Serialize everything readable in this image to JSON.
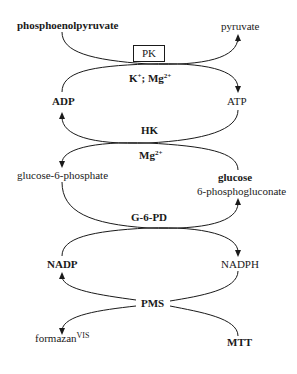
{
  "diagram": {
    "type": "coupled enzymatic reaction cascade",
    "nodes": {
      "phosphoenolpyruvate": "phosphoenolpyruvate",
      "pyruvate": "pyruvate",
      "adp": "ADP",
      "atp": "ATP",
      "glucose_6_phosphate": "glucose-6-phosphate",
      "glucose": "glucose",
      "phosphogluconate": "6-phosphogluconate",
      "nadp": "NADP",
      "nadph": "NADPH",
      "formazan": "formazan",
      "formazan_sup": "VIS",
      "mtt": "MTT"
    },
    "enzymes": {
      "pk": "PK",
      "hk": "HK",
      "g6pd": "G-6-PD",
      "pms": "PMS"
    },
    "cofactors": {
      "pk_k": "K",
      "pk_k_sup": "+",
      "pk_sep": "; Mg",
      "pk_mg_sup": "2+",
      "hk_mg": "Mg",
      "hk_mg_sup": "2+"
    },
    "colors": {
      "line": "#1a1a1a",
      "background": "#ffffff"
    }
  }
}
